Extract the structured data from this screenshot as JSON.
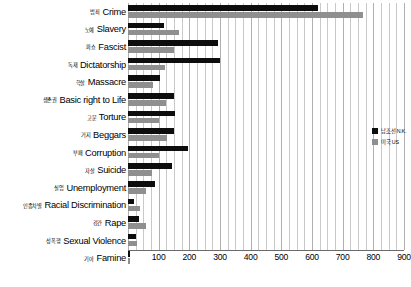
{
  "chart_data": {
    "type": "bar",
    "orientation": "horizontal",
    "title": "",
    "xlabel": "",
    "ylabel": "",
    "xlim": [
      0,
      900
    ],
    "xticks": [
      0,
      100,
      200,
      300,
      400,
      500,
      600,
      700,
      800,
      900
    ],
    "xtick_labels": [
      "",
      "100",
      "200",
      "300",
      "400",
      "500",
      "600",
      "700",
      "800",
      "900"
    ],
    "minor_gridlines": true,
    "minor_tick_step": 25,
    "grid": true,
    "legend_position": "right",
    "categories": [
      "Crime",
      "Slavery",
      "Fascist",
      "Dictatorship",
      "Massacre",
      "Basic right to Life",
      "Torture",
      "Beggars",
      "Corruption",
      "Suicide",
      "Unemployment",
      "Racial Discrimination",
      "Rape",
      "Sexual Violence",
      "Famine"
    ],
    "categories_ko": [
      "범죄",
      "노예",
      "파쇼",
      "독재",
      "학살",
      "생존권",
      "고문",
      "거지",
      "부패",
      "자살",
      "실업",
      "인종차별",
      "강간",
      "성폭행",
      "기아"
    ],
    "series": [
      {
        "name": "남조선 N.K.",
        "color": "#0d0d0d",
        "values": [
          620,
          118,
          295,
          300,
          105,
          150,
          152,
          150,
          197,
          142,
          88,
          18,
          35,
          25,
          8
        ]
      },
      {
        "name": "미국 US",
        "color": "#8f8f8f",
        "values": [
          765,
          165,
          150,
          122,
          80,
          125,
          100,
          128,
          100,
          78,
          58,
          38,
          58,
          30,
          5
        ]
      }
    ]
  },
  "legend": {
    "entries": [
      {
        "label": "남조선 N.K.",
        "swatch": "#0d0d0d"
      },
      {
        "label": "미국 US",
        "swatch": "#8f8f8f"
      }
    ]
  }
}
